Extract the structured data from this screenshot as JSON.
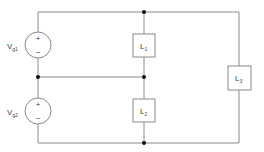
{
  "diagram": {
    "type": "circuit-schematic",
    "colors": {
      "wire": "#8a8a8a",
      "junction": "#111111",
      "text": "#444444",
      "background": "#ffffff"
    },
    "sources": [
      {
        "id": "vg1",
        "name": "V",
        "subscript": "g1",
        "plus": "+",
        "minus": "−"
      },
      {
        "id": "vg2",
        "name": "V",
        "subscript": "g2",
        "plus": "+",
        "minus": "−"
      }
    ],
    "loads": [
      {
        "id": "l1",
        "name": "L",
        "subscript": "1"
      },
      {
        "id": "l2",
        "name": "L",
        "subscript": "2"
      },
      {
        "id": "l3",
        "name": "L",
        "subscript": "3"
      }
    ]
  }
}
